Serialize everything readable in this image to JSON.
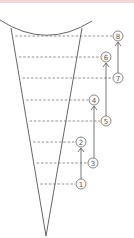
{
  "colors": {
    "top_band": "#f7d6da",
    "stroke": "#555555",
    "dash": "#777777",
    "circle_fill": "#ffffff"
  },
  "diagram": {
    "arc": {
      "x1": 0,
      "y1": 20,
      "cx": 46,
      "cy": 50,
      "x2": 92,
      "y2": 21
    },
    "cone": {
      "left_top": [
        11,
        28
      ],
      "right_top": [
        82,
        28
      ],
      "apex": [
        46,
        236
      ]
    },
    "levels": [
      {
        "label": "8",
        "y": 36,
        "cx": 118
      },
      {
        "label": "6",
        "y": 57,
        "cx": 106
      },
      {
        "label": "7",
        "y": 78,
        "cx": 118
      },
      {
        "label": "4",
        "y": 100,
        "cx": 94
      },
      {
        "label": "5",
        "y": 121,
        "cx": 106
      },
      {
        "label": "2",
        "y": 142,
        "cx": 81
      },
      {
        "label": "3",
        "y": 163,
        "cx": 93
      },
      {
        "label": "1",
        "y": 184,
        "cx": 81
      }
    ],
    "arrows": [
      {
        "from": "1",
        "to": "2"
      },
      {
        "from": "3",
        "to": "4"
      },
      {
        "from": "5",
        "to": "6"
      },
      {
        "from": "7",
        "to": "8"
      }
    ]
  }
}
